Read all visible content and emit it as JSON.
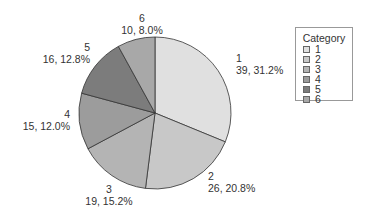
{
  "chart_data": {
    "type": "pie",
    "title": "",
    "legend_title": "Category",
    "legend_position": "right",
    "categories": [
      "1",
      "2",
      "3",
      "4",
      "5",
      "6"
    ],
    "values": [
      39,
      26,
      19,
      15,
      16,
      10
    ],
    "percentages": [
      31.2,
      20.8,
      15.2,
      12.0,
      12.8,
      8.0
    ],
    "labels": [
      "39, 31.2%",
      "26, 20.8%",
      "19, 15.2%",
      "15, 12.0%",
      "16, 12.8%",
      "10, 8.0%"
    ],
    "colors": [
      "#e0e0e0",
      "#c8c8c8",
      "#b4b4b4",
      "#9c9c9c",
      "#7c7c7c",
      "#a8a8a8"
    ],
    "total": 125
  },
  "legend": {
    "title": "Category",
    "items": [
      {
        "label": "1",
        "color": "#e0e0e0"
      },
      {
        "label": "2",
        "color": "#c8c8c8"
      },
      {
        "label": "3",
        "color": "#b4b4b4"
      },
      {
        "label": "4",
        "color": "#9c9c9c"
      },
      {
        "label": "5",
        "color": "#7c7c7c"
      },
      {
        "label": "6",
        "color": "#a8a8a8"
      }
    ]
  },
  "slice_labels": [
    {
      "name": "1",
      "value": "39, 31.2%"
    },
    {
      "name": "2",
      "value": "26, 20.8%"
    },
    {
      "name": "3",
      "value": "19, 15.2%"
    },
    {
      "name": "4",
      "value": "15, 12.0%"
    },
    {
      "name": "5",
      "value": "16, 12.8%"
    },
    {
      "name": "6",
      "value": "10, 8.0%"
    }
  ]
}
